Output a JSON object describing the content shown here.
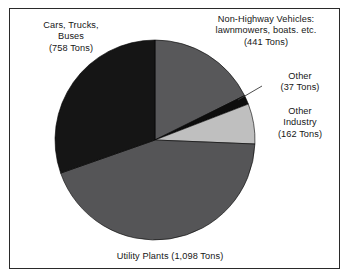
{
  "figure": {
    "background_color": "#ffffff",
    "border_color": "#2a2a2a",
    "text_color": "#161616"
  },
  "labels": {
    "cars": "Cars, Trucks,\nBuses\n(758 Tons)",
    "non_highway": "Non-Highway Vehicles:\nlawnmowers, boats. etc.\n(441 Tons)",
    "other": "Other\n(37 Tons)",
    "other_industry": "Other\nIndustry\n(162 Tons)",
    "utility": "Utility Plants (1,098 Tons)"
  },
  "chart_data": {
    "type": "pie",
    "title": "",
    "unit": "Tons",
    "total": 2496,
    "start_angle_deg": 90,
    "direction": "clockwise",
    "center_px": [
      155,
      140
    ],
    "radius_px": 100,
    "categories": [
      "Non-Highway Vehicles: lawnmowers, boats. etc.",
      "Other",
      "Other Industry",
      "Utility Plants",
      "Cars, Trucks, Buses"
    ],
    "values": [
      441,
      37,
      162,
      1098,
      758
    ],
    "value_labels": [
      "441 Tons",
      "37 Tons",
      "162 Tons",
      "1,098 Tons",
      "758 Tons"
    ],
    "percentages": [
      17.7,
      1.5,
      6.5,
      44.0,
      30.4
    ],
    "colors": [
      "#58585a",
      "#0d0d0d",
      "#bfbfbf",
      "#555557",
      "#151515"
    ],
    "slice_edge_color": "#000000",
    "legend": "none",
    "labels_placement": "outside-callout",
    "grid": false
  },
  "annotations": {
    "other_leader_line": {
      "from_px": [
        238,
        100
      ],
      "to_px": [
        262,
        86
      ],
      "color": "#3a3a3a"
    }
  }
}
